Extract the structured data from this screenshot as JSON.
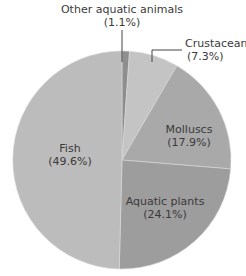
{
  "chart_data": {
    "type": "pie",
    "title": "",
    "start_angle_deg": 0,
    "direction": "clockwise",
    "slices": [
      {
        "label": "Other aquatic animals",
        "value": 1.1,
        "pct_label": "(1.1%)",
        "color": "#8e8e8e"
      },
      {
        "label": "Crustaceans",
        "value": 7.3,
        "pct_label": "(7.3%)",
        "color": "#c4c4c4"
      },
      {
        "label": "Molluscs",
        "value": 17.9,
        "pct_label": "(17.9%)",
        "color": "#a9a9a9"
      },
      {
        "label": "Aquatic plants",
        "value": 24.1,
        "pct_label": "(24.1%)",
        "color": "#9d9d9d"
      },
      {
        "label": "Fish",
        "value": 49.6,
        "pct_label": "(49.6%)",
        "color": "#bcbcbc"
      }
    ],
    "legend": "none",
    "labels": "inside/leader-lines"
  },
  "geometry": {
    "cx": 122,
    "cy": 160,
    "r": 109
  },
  "labels": {
    "other": {
      "name": "Other aquatic animals",
      "pct": "(1.1%)"
    },
    "crustaceans": {
      "name": "Crustaceans",
      "pct": "(7.3%)"
    },
    "molluscs": {
      "name": "Molluscs",
      "pct": "(17.9%)"
    },
    "plants": {
      "name": "Aquatic plants",
      "pct": "(24.1%)"
    },
    "fish": {
      "name": "Fish",
      "pct": "(49.6%)"
    }
  }
}
